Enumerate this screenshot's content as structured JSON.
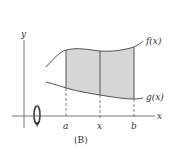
{
  "figure": {
    "caption": "(B)",
    "axes": {
      "x_label": "x",
      "y_label": "y"
    },
    "curves": {
      "upper_label": "f(x)",
      "lower_label": "g(x)"
    },
    "ticks": {
      "a": "a",
      "x": "x",
      "b": "b"
    },
    "icons": {
      "rotation": "rotation-arrow-icon"
    },
    "colors": {
      "stroke": "#555555",
      "shade": "#d6d6d6",
      "text": "#333333"
    }
  }
}
